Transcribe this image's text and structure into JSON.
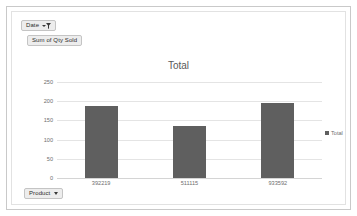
{
  "field_buttons": {
    "date": {
      "label": "Date",
      "icon": "filter-dropdown-icon"
    },
    "value": {
      "label": "Sum of Qty Sold"
    },
    "product": {
      "label": "Product",
      "icon": "chevron-down-icon"
    }
  },
  "chart_data": {
    "type": "bar",
    "title": "Total",
    "xlabel": "",
    "ylabel": "",
    "categories": [
      "392219",
      "511115",
      "933592"
    ],
    "values": [
      187,
      136,
      196
    ],
    "series": [
      {
        "name": "Total",
        "values": [
          187,
          136,
          196
        ]
      }
    ],
    "ylim": [
      0,
      250
    ],
    "yticks": [
      "0",
      "50",
      "100",
      "150",
      "200",
      "250"
    ],
    "ytick_values": [
      0,
      50,
      100,
      150,
      200,
      250
    ],
    "grid": true,
    "legend": {
      "position": "right",
      "entries": [
        "Total"
      ]
    },
    "bar_color": "#5f5f5f",
    "grid_color": "#e4e4e4",
    "text_color": "#6e6e6e"
  }
}
